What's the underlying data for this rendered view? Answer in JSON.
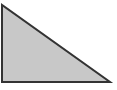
{
  "diagram": {
    "shape": "right-triangle",
    "vertices": [
      [
        2,
        5
      ],
      [
        2,
        82
      ],
      [
        110,
        82
      ]
    ],
    "fill": "#c8c8c8",
    "stroke": "#333333",
    "stroke_width": 2
  }
}
